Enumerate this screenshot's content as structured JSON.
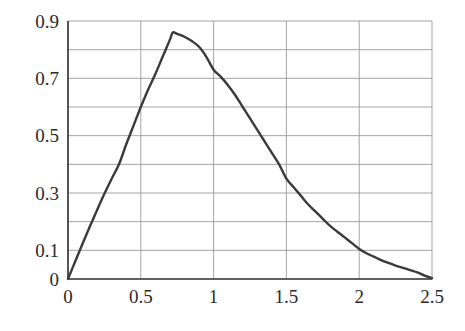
{
  "chart_data": {
    "type": "line",
    "title": "",
    "xlabel": "",
    "ylabel": "",
    "xlim": [
      0,
      2.5
    ],
    "ylim": [
      0,
      0.9
    ],
    "grid": true,
    "legend": null,
    "legend_position": "none",
    "x_ticks": [
      0,
      0.5,
      1,
      1.5,
      2,
      2.5
    ],
    "x_tick_labels": [
      "0",
      "0.5",
      "1",
      "1.5",
      "2",
      "2.5"
    ],
    "y_ticks": [
      0,
      0.1,
      0.3,
      0.5,
      0.7,
      0.9
    ],
    "y_tick_labels": [
      "0",
      "0.1",
      "0.3",
      "0.5",
      "0.7",
      "0.9"
    ],
    "y_gridlines": [
      0.1,
      0.2,
      0.3,
      0.4,
      0.5,
      0.6,
      0.7,
      0.8,
      0.9
    ],
    "x_gridlines": [
      0.5,
      1,
      1.5,
      2,
      2.5
    ],
    "peak": {
      "x": 0.72,
      "y": 0.86
    },
    "series": [
      {
        "name": "curve",
        "color": "#3a3a3a",
        "line_width": 2.4,
        "x": [
          0,
          0.05,
          0.1,
          0.15,
          0.2,
          0.25,
          0.3,
          0.35,
          0.4,
          0.45,
          0.5,
          0.55,
          0.6,
          0.65,
          0.7,
          0.72,
          0.75,
          0.8,
          0.85,
          0.9,
          0.95,
          1,
          1.05,
          1.1,
          1.15,
          1.2,
          1.25,
          1.3,
          1.35,
          1.4,
          1.45,
          1.5,
          1.55,
          1.6,
          1.65,
          1.7,
          1.75,
          1.8,
          1.85,
          1.9,
          1.95,
          2,
          2.05,
          2.1,
          2.15,
          2.2,
          2.25,
          2.3,
          2.35,
          2.4,
          2.45,
          2.5
        ],
        "y": [
          0,
          0.062,
          0.123,
          0.183,
          0.241,
          0.297,
          0.35,
          0.4,
          0.47,
          0.535,
          0.6,
          0.66,
          0.715,
          0.775,
          0.835,
          0.86,
          0.855,
          0.845,
          0.83,
          0.81,
          0.775,
          0.73,
          0.705,
          0.675,
          0.64,
          0.6,
          0.56,
          0.52,
          0.48,
          0.44,
          0.4,
          0.35,
          0.32,
          0.29,
          0.26,
          0.235,
          0.21,
          0.185,
          0.165,
          0.145,
          0.125,
          0.105,
          0.09,
          0.078,
          0.066,
          0.056,
          0.047,
          0.039,
          0.031,
          0.023,
          0.012,
          0.003
        ]
      }
    ],
    "colors": {
      "curve": "#3a3a3a",
      "grid": "#9a9a9a",
      "axis": "#2b2b2b",
      "tick_text": "#2b2b2b",
      "background": "#ffffff"
    },
    "plot_box": {
      "left": 68,
      "top": 21,
      "right": 432,
      "bottom": 279
    }
  }
}
